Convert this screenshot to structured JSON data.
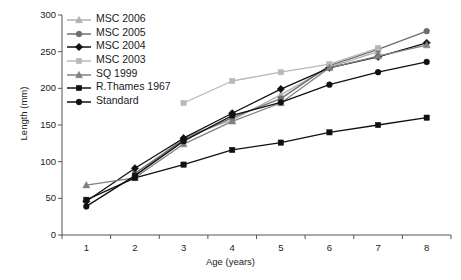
{
  "chart_data": {
    "type": "line",
    "title": "",
    "xlabel": "Age (years)",
    "ylabel": "Length (mm)",
    "x": [
      1,
      2,
      3,
      4,
      5,
      6,
      7,
      8
    ],
    "xtick_labels": [
      "1",
      "2",
      "3",
      "4",
      "5",
      "6",
      "7",
      "8"
    ],
    "ytick_labels": [
      "0",
      "50",
      "100",
      "150",
      "200",
      "250",
      "300"
    ],
    "yticks": [
      0,
      50,
      100,
      150,
      200,
      250,
      300
    ],
    "ylim": [
      0,
      300
    ],
    "grid": false,
    "legend_position": "top-left",
    "series": [
      {
        "name": "MSC 2006",
        "marker": "triangle",
        "color": "#b0b0b0",
        "values": [
          null,
          80,
          133,
          157,
          191,
          229,
          250,
          null
        ]
      },
      {
        "name": "MSC 2005",
        "marker": "circle",
        "color": "#6e6e6e",
        "values": [
          null,
          84,
          130,
          160,
          186,
          231,
          253,
          278
        ]
      },
      {
        "name": "MSC 2004",
        "marker": "diamond",
        "color": "#111111",
        "values": [
          46,
          91,
          132,
          166,
          199,
          228,
          243,
          262
        ]
      },
      {
        "name": "MSC 2003",
        "marker": "square",
        "color": "#b8b8b8",
        "values": [
          null,
          null,
          180,
          210,
          222,
          233,
          255,
          null
        ]
      },
      {
        "name": "SQ 1999",
        "marker": "triangle",
        "color": "#808080",
        "values": [
          68,
          78,
          124,
          155,
          180,
          228,
          244,
          259
        ]
      },
      {
        "name": "R.Thames 1967",
        "marker": "square",
        "color": "#111111",
        "values": [
          48,
          78,
          96,
          116,
          126,
          140,
          150,
          160
        ]
      },
      {
        "name": "Standard",
        "marker": "circle",
        "color": "#111111",
        "values": [
          39,
          81,
          128,
          163,
          181,
          205,
          222,
          236
        ]
      }
    ]
  },
  "axes": {
    "y_title": "Length (mm)",
    "x_title": "Age (years)"
  }
}
